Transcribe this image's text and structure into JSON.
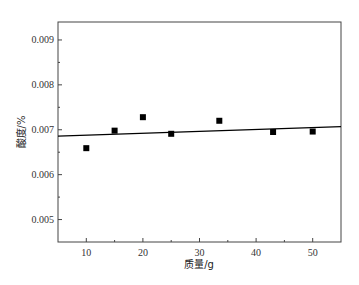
{
  "chart_data": {
    "type": "scatter",
    "title": "",
    "xlabel": "质量/g",
    "ylabel": "酸度/%",
    "xlim": [
      5,
      55
    ],
    "ylim": [
      0.0045,
      0.0094
    ],
    "x_ticks": [
      10,
      20,
      30,
      40,
      50
    ],
    "x_tick_labels": [
      "10",
      "20",
      "30",
      "40",
      "50"
    ],
    "y_ticks": [
      0.005,
      0.006,
      0.007,
      0.008,
      0.009
    ],
    "y_tick_labels": [
      "0.005",
      "0.006",
      "0.007",
      "0.008",
      "0.009"
    ],
    "grid": false,
    "legend": null,
    "series": [
      {
        "name": "measured",
        "marker": "square",
        "color": "#000000",
        "x": [
          10,
          15,
          20,
          25,
          33.5,
          43,
          50
        ],
        "y": [
          0.00659,
          0.00698,
          0.00728,
          0.00691,
          0.0072,
          0.00695,
          0.00696
        ]
      },
      {
        "name": "linear fit",
        "type": "line",
        "color": "#000000",
        "x": [
          5,
          55
        ],
        "y": [
          0.00686,
          0.00707
        ]
      }
    ]
  }
}
